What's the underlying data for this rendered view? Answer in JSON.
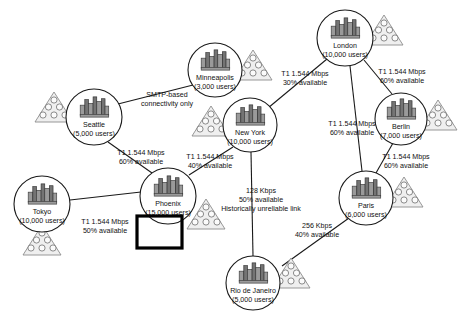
{
  "diagram": {
    "type": "network-topology",
    "canvas": {
      "width": 464,
      "height": 312
    },
    "nodes": [
      {
        "id": "seattle",
        "name": "Seattle",
        "users": "(5,000 users)",
        "cx": 94,
        "cy": 117,
        "r": 28,
        "icon": "city-buildings-icon",
        "users_group": {
          "side": "left",
          "dx": -40,
          "dy": -10
        }
      },
      {
        "id": "minneapolis",
        "name": "Minneapolis",
        "users": "(3,000 users)",
        "cx": 215,
        "cy": 70,
        "r": 27,
        "icon": "city-buildings-icon",
        "users_group": {
          "side": "right",
          "dx": 38,
          "dy": -5
        }
      },
      {
        "id": "newyork",
        "name": "New York",
        "users": "(10,000 users)",
        "cx": 250,
        "cy": 125,
        "r": 27,
        "icon": "city-buildings-icon",
        "users_group": {
          "side": "left",
          "dx": -39,
          "dy": -4
        }
      },
      {
        "id": "london",
        "name": "London",
        "users": "(10,000 users)",
        "cx": 345,
        "cy": 38,
        "r": 28,
        "icon": "city-buildings-icon",
        "users_group": {
          "side": "right",
          "dx": 39,
          "dy": -8
        }
      },
      {
        "id": "berlin",
        "name": "Berlin",
        "users": "(7,000 users)",
        "cx": 401,
        "cy": 119,
        "r": 26,
        "icon": "city-buildings-icon",
        "users_group": {
          "side": "right",
          "dx": 37,
          "dy": -4
        }
      },
      {
        "id": "paris",
        "name": "Paris",
        "users": "(6,000 users)",
        "cx": 366,
        "cy": 198,
        "r": 27,
        "icon": "city-buildings-icon",
        "users_group": {
          "side": "right",
          "dx": 38,
          "dy": -6
        }
      },
      {
        "id": "phoenix",
        "name": "Phoenix",
        "users": "(15,000 users)",
        "cx": 168,
        "cy": 196,
        "r": 28,
        "icon": "city-buildings-icon",
        "users_group": {
          "side": "right",
          "dx": 38,
          "dy": 18
        }
      },
      {
        "id": "tokyo",
        "name": "Tokyo",
        "users": "(10,000 users)",
        "cx": 42,
        "cy": 204,
        "r": 28,
        "icon": "city-buildings-icon",
        "users_group": {
          "side": "below",
          "dx": 0,
          "dy": 36
        }
      },
      {
        "id": "rio",
        "name": "Rio de Janeiro",
        "users": "(5,000 users)",
        "cx": 253,
        "cy": 283,
        "r": 27,
        "icon": "city-buildings-icon",
        "users_group": {
          "side": "right",
          "dx": 38,
          "dy": -10
        }
      }
    ],
    "links": [
      {
        "id": "seattle-minneapolis",
        "from": "seattle",
        "to": "minneapolis",
        "x1": 118,
        "y1": 104,
        "x2": 197,
        "y2": 84,
        "label_lines": [
          "SMTP-based",
          "connectivity only"
        ],
        "label_x": 167,
        "label_y": 99,
        "bandwidth": "",
        "availability": ""
      },
      {
        "id": "seattle-phoenix",
        "from": "seattle",
        "to": "phoenix",
        "x1": 108,
        "y1": 142,
        "x2": 152,
        "y2": 173,
        "label_lines": [
          "T1 1.544 Mbps",
          "60% available"
        ],
        "label_x": 141,
        "label_y": 157,
        "bandwidth": "T1 1.544 Mbps",
        "availability": "60% available"
      },
      {
        "id": "newyork-phoenix",
        "from": "newyork",
        "to": "phoenix",
        "x1": 233,
        "y1": 147,
        "x2": 189,
        "y2": 175,
        "label_lines": [
          "T1 1.544 Mbps",
          "40% available"
        ],
        "label_x": 210,
        "label_y": 161,
        "bandwidth": "T1 1.544 Mbps",
        "availability": "40% available"
      },
      {
        "id": "newyork-london",
        "from": "newyork",
        "to": "london",
        "x1": 268,
        "y1": 108,
        "x2": 327,
        "y2": 59,
        "label_lines": [
          "T1 1.544 Mbps",
          "30% available"
        ],
        "label_x": 305,
        "label_y": 78,
        "bandwidth": "T1 1.544 Mbps",
        "availability": "30% available"
      },
      {
        "id": "london-berlin",
        "from": "london",
        "to": "berlin",
        "x1": 364,
        "y1": 60,
        "x2": 392,
        "y2": 94,
        "label_lines": [
          "T1 1.544 Mbps",
          "60% available"
        ],
        "label_x": 402,
        "label_y": 76,
        "bandwidth": "T1 1.544 Mbps",
        "availability": "60% available"
      },
      {
        "id": "london-paris",
        "from": "london",
        "to": "paris",
        "x1": 350,
        "y1": 66,
        "x2": 362,
        "y2": 171,
        "label_lines": [
          "T1 1.544 Mbps",
          "60% available"
        ],
        "label_x": 352,
        "label_y": 128,
        "bandwidth": "T1 1.544 Mbps",
        "availability": "60% available"
      },
      {
        "id": "berlin-paris",
        "from": "berlin",
        "to": "paris",
        "x1": 393,
        "y1": 143,
        "x2": 376,
        "y2": 173,
        "label_lines": [
          "T1 1.544 Mbps",
          "60% available"
        ],
        "label_x": 406,
        "label_y": 161,
        "bandwidth": "T1 1.544 Mbps",
        "availability": "60% available"
      },
      {
        "id": "newyork-rio",
        "from": "newyork",
        "to": "rio",
        "x1": 251,
        "y1": 152,
        "x2": 253,
        "y2": 256,
        "label_lines": [
          "128 Kbps",
          "50% available",
          "Historically unreliable link"
        ],
        "label_x": 261,
        "label_y": 200,
        "bandwidth": "128 Kbps",
        "availability": "50% available",
        "note": "Historically unreliable link"
      },
      {
        "id": "paris-rio",
        "from": "paris",
        "to": "rio",
        "x1": 349,
        "y1": 218,
        "x2": 282,
        "y2": 266,
        "label_lines": [
          "256 Kbps",
          "40% available"
        ],
        "label_x": 317,
        "label_y": 230,
        "bandwidth": "256 Kbps",
        "availability": "40% available"
      },
      {
        "id": "tokyo-phoenix",
        "from": "tokyo",
        "to": "phoenix",
        "x1": 70,
        "y1": 200,
        "x2": 141,
        "y2": 192,
        "label_lines": [
          "T1 1.544 Mbps",
          "50% available"
        ],
        "label_x": 105,
        "label_y": 226,
        "bandwidth": "T1 1.544 Mbps",
        "availability": "50% available"
      }
    ],
    "selection": {
      "id": "phoenix-local-users-selected",
      "target": "phoenix",
      "x": 137,
      "y": 216,
      "width": 45,
      "height": 32,
      "label": "selected user group"
    }
  }
}
